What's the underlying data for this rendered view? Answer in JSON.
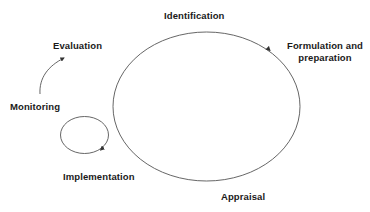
{
  "diagram": {
    "type": "cycle",
    "title": "",
    "stages": {
      "identification": "Identification",
      "formulation_line1": "Formulation and",
      "formulation_line2": "preparation",
      "appraisal": "Appraisal",
      "implementation": "Implementation",
      "monitoring": "Monitoring",
      "evaluation": "Evaluation"
    },
    "major_cycle": {
      "shape": "ellipse",
      "direction": "clockwise",
      "arrow_near": "Formulation and preparation"
    },
    "minor_cycle": {
      "shape": "ellipse",
      "direction": "clockwise",
      "arrow_near": "Implementation"
    },
    "evaluation_arrow": {
      "from": "Monitoring",
      "to": "Evaluation"
    },
    "colors": {
      "line": "#555555",
      "text": "#1a1a1a",
      "background": "#ffffff"
    }
  }
}
